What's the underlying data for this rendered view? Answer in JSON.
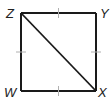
{
  "diagram": {
    "shape": "square",
    "name": "WXYZ",
    "vertices": {
      "Z": {
        "label": "Z",
        "x": 21,
        "y": 13
      },
      "Y": {
        "label": "Y",
        "x": 96,
        "y": 13
      },
      "W": {
        "label": "W",
        "x": 21,
        "y": 91
      },
      "X": {
        "label": "X",
        "x": 96,
        "y": 91
      }
    },
    "diagonal": [
      "Z",
      "X"
    ],
    "congruence_ticks": [
      "ZY",
      "YX",
      "XW",
      "WZ"
    ],
    "colors": {
      "stroke": "#1a1a1a",
      "tick": "#b0b0b0",
      "background": "#ffffff"
    }
  }
}
